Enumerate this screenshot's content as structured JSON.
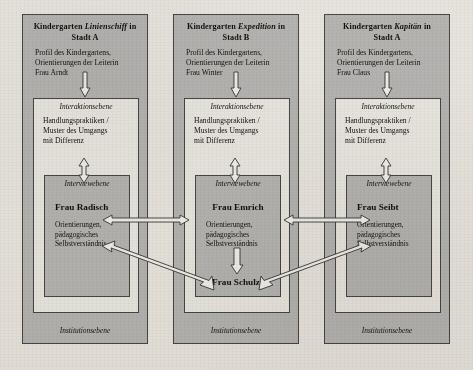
{
  "figure": {
    "background_color": "#f2f0ec",
    "box_fill_gray": "#bdbdbd",
    "box_fill_white": "#f3f2ef",
    "outline_color": "#4a4a4a",
    "arrow_fill": "#fbfbfa"
  },
  "columns": [
    {
      "id": "kindergarten-linienschiff",
      "title_prefix": "Kindergarten ",
      "title_name": "Linienschiff",
      "title_suffix": " in",
      "title_line2": "Stadt A",
      "profile_line1": "Profil des Kindergartens,",
      "profile_line2": "Orientierungen der Leiterin",
      "profile_line3": "Frau Arndt",
      "interaktion_label": "Interaktionsebene",
      "interaktion_line1": "Handlungspraktiken /",
      "interaktion_line2": "Muster des Umgangs",
      "interaktion_line3": "mit Differenz",
      "interview_label": "Interviewebene",
      "person_primary": "Frau Radisch",
      "person_body_line1": "Orientierungen,",
      "person_body_line2": "pädagogisches",
      "person_body_line3": "Selbstverständnis",
      "institution_label": "Institutionsebene"
    },
    {
      "id": "kindergarten-expedition",
      "title_prefix": "Kindergarten ",
      "title_name": "Expedition",
      "title_suffix": " in",
      "title_line2": "Stadt B",
      "profile_line1": "Profil des Kindergartens,",
      "profile_line2": "Orientierungen der Leiterin",
      "profile_line3": "Frau Winter",
      "interaktion_label": "Interaktionsebene",
      "interaktion_line1": "Handlungspraktiken /",
      "interaktion_line2": "Muster des Umgangs",
      "interaktion_line3": "mit Differenz",
      "interview_label": "Interviewebene",
      "person_primary": "Frau Emrich",
      "person_body_line1": "Orientierungen,",
      "person_body_line2": "pädagogisches",
      "person_body_line3": "Selbstverständnis",
      "person_secondary": "Frau Schulze",
      "institution_label": "Institutionsebene"
    },
    {
      "id": "kindergarten-kapitaen",
      "title_prefix": "Kindergarten ",
      "title_name": "Kapitän",
      "title_suffix": " in",
      "title_line2": "Stadt A",
      "profile_line1": "Profil des Kindergartens,",
      "profile_line2": "Orientierungen der Leiterin",
      "profile_line3": "Frau Claus",
      "interaktion_label": "Interaktionsebene",
      "interaktion_line1": "Handlungspraktiken /",
      "interaktion_line2": "Muster des Umgangs",
      "interaktion_line3": "mit Differenz",
      "interview_label": "Interviewebene",
      "person_primary": "Frau Seibt",
      "person_body_line1": "Orientierungen,",
      "person_body_line2": "pädagogisches",
      "person_body_line3": "Selbstverständnis",
      "institution_label": "Institutionsebene"
    }
  ],
  "connectors": [
    {
      "id": "arrow-profile-to-interaktion-col1",
      "kind": "down-arrow"
    },
    {
      "id": "arrow-profile-to-interaktion-col2",
      "kind": "down-arrow"
    },
    {
      "id": "arrow-profile-to-interaktion-col3",
      "kind": "down-arrow"
    },
    {
      "id": "arrow-interaktion-interview-col1",
      "kind": "double-vertical"
    },
    {
      "id": "arrow-interaktion-interview-col2",
      "kind": "double-vertical"
    },
    {
      "id": "arrow-interaktion-interview-col3",
      "kind": "double-vertical"
    },
    {
      "id": "arrow-radisch-emrich",
      "kind": "double-horizontal"
    },
    {
      "id": "arrow-emrich-seibt",
      "kind": "double-horizontal"
    },
    {
      "id": "arrow-emrich-schulze",
      "kind": "down-arrow"
    },
    {
      "id": "arrow-radisch-schulze",
      "kind": "double-diagonal"
    },
    {
      "id": "arrow-seibt-schulze",
      "kind": "double-diagonal"
    }
  ]
}
